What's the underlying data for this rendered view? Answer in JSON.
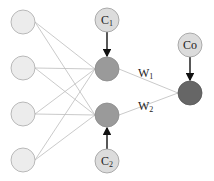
{
  "diagram": {
    "title": "",
    "colors": {
      "input_fill": "#ececec",
      "input_stroke": "#aaaaaa",
      "hidden_fill": "#9a9a9a",
      "hidden_stroke": "#8a8a8a",
      "output_fill": "#666666",
      "output_stroke": "#555555",
      "context_fill": "#dcdcdc",
      "context_stroke": "#9a9a9a",
      "edge": "#bdbdbd",
      "arrow": "#111111"
    },
    "input_nodes": [
      {
        "id": "in1",
        "cx": 23,
        "cy": 22
      },
      {
        "id": "in2",
        "cx": 23,
        "cy": 68
      },
      {
        "id": "in3",
        "cx": 23,
        "cy": 114
      },
      {
        "id": "in4",
        "cx": 23,
        "cy": 160
      }
    ],
    "hidden_nodes": [
      {
        "id": "h1",
        "cx": 107,
        "cy": 69
      },
      {
        "id": "h2",
        "cx": 107,
        "cy": 115
      }
    ],
    "output_node": {
      "id": "out",
      "cx": 190,
      "cy": 93
    },
    "context_nodes": [
      {
        "id": "c1",
        "label_main": "C",
        "label_sub": "1",
        "cx": 107,
        "cy": 20,
        "target": "h1"
      },
      {
        "id": "c2",
        "label_main": "C",
        "label_sub": "2",
        "cx": 107,
        "cy": 161,
        "target": "h2"
      },
      {
        "id": "co",
        "label_main": "Co",
        "label_sub": "",
        "cx": 190,
        "cy": 45,
        "target": "out"
      }
    ],
    "weights": [
      {
        "id": "w1",
        "label_main": "W",
        "label_sub": "1",
        "x": 138,
        "y": 77
      },
      {
        "id": "w2",
        "label_main": "W",
        "label_sub": "2",
        "x": 138,
        "y": 110
      }
    ]
  }
}
